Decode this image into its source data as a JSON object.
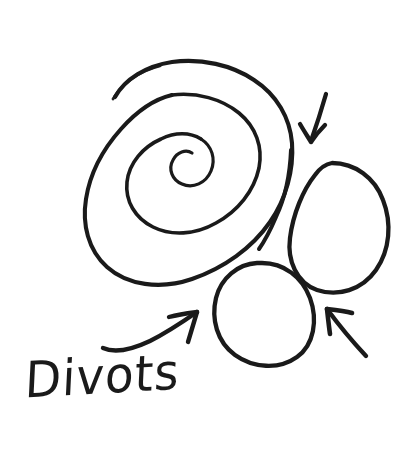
{
  "figure": {
    "kind": "hand-drawn-sketch",
    "title_text": "Divots",
    "background_color": "#ffffff",
    "ink_color": "#1a1a1a",
    "width": 417,
    "height": 452
  },
  "annotations": {
    "label": "Divots",
    "arrow_down_name": "arrow-down-left",
    "arrow_up_name": "arrow-up-left",
    "arrow_curved_name": "curved-arrow-up-right"
  },
  "shapes": {
    "spiral_name": "spiral-swirl",
    "oval_right_name": "oval-right",
    "oval_bottom_name": "oval-bottom-left"
  }
}
